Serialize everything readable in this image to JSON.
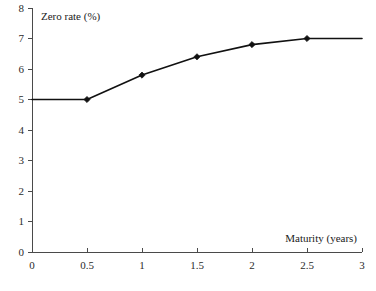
{
  "chart_data": {
    "type": "line",
    "title": "",
    "xlabel": "Maturity (years)",
    "ylabel": "Zero rate (%)",
    "xlim": [
      0,
      3
    ],
    "ylim": [
      0,
      8
    ],
    "grid": false,
    "legend": null,
    "xticks": [
      "0",
      "0.5",
      "1",
      "1.5",
      "2",
      "2.5",
      "3"
    ],
    "xtick_values": [
      0,
      0.5,
      1,
      1.5,
      2,
      2.5,
      3
    ],
    "yticks": [
      "0",
      "1",
      "2",
      "3",
      "4",
      "5",
      "6",
      "7",
      "8"
    ],
    "ytick_values": [
      0,
      1,
      2,
      3,
      4,
      5,
      6,
      7,
      8
    ],
    "x": [
      0,
      0.5,
      1,
      1.5,
      2,
      2.5,
      3
    ],
    "values": [
      5.0,
      5.0,
      5.8,
      6.4,
      6.8,
      7.0,
      7.0
    ],
    "marker_x": [
      0.5,
      1,
      1.5,
      2,
      2.5
    ],
    "marker_values": [
      5.0,
      5.8,
      6.4,
      6.8,
      7.0
    ],
    "line_color": "#111111",
    "axis_color": "#4a4a4a",
    "marker_shape": "diamond"
  },
  "labels": {
    "y_axis_caption": "Zero rate (%)",
    "x_axis_caption": "Maturity (years)"
  }
}
